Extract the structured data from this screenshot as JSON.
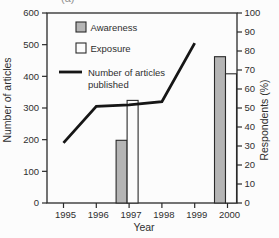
{
  "figure": {
    "corner_label": "(a)"
  },
  "chart_data": {
    "type": "bar+line",
    "title": "",
    "xlabel": "Year",
    "categories": [
      "1995",
      "1996",
      "1997",
      "1998",
      "1999",
      "2000"
    ],
    "axes": {
      "left": {
        "label": "Number of articles",
        "min": 0,
        "max": 600,
        "step": 100
      },
      "right": {
        "label": "Respondents (%)",
        "min": 0,
        "max": 100,
        "step": 10
      }
    },
    "series": [
      {
        "name": "Awareness",
        "type": "bar",
        "axis": "right",
        "unit": "%",
        "fill": "#b5b5b5",
        "values": [
          null,
          null,
          33,
          null,
          null,
          77
        ]
      },
      {
        "name": "Exposure",
        "type": "bar",
        "axis": "right",
        "unit": "%",
        "fill": "#fcfcfc",
        "values": [
          null,
          null,
          54,
          null,
          null,
          68
        ]
      },
      {
        "name": "Number of articles published",
        "type": "line",
        "axis": "left",
        "unit": "articles",
        "color": "#161616",
        "values": [
          190,
          305,
          310,
          320,
          505,
          null
        ],
        "legend_lines": [
          "Number of articles",
          "published"
        ]
      }
    ],
    "legend": {
      "position": "top-left"
    },
    "grid": false,
    "colors": {
      "axis": "#2a2a2a",
      "text": "#2f2f2f",
      "background": "#fcfcfc"
    }
  }
}
